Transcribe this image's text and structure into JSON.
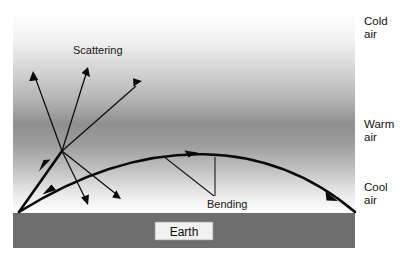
{
  "figure": {
    "canvas": {
      "width": 413,
      "height": 262,
      "background": "#ffffff"
    }
  },
  "labels": {
    "scattering": "Scattering",
    "bending": "Bending",
    "earth": "Earth",
    "cold_air_line1": "Cold",
    "cold_air_line2": "air",
    "warm_air_line1": "Warm",
    "warm_air_line2": "air",
    "cool_air_line1": "Cool",
    "cool_air_line2": "air"
  },
  "colors": {
    "ground": "#6e6e6e",
    "ray": "#0a0a0a",
    "text": "#111111",
    "earth_label_fill": "#f2f2f2",
    "atmosphere_top": "#ffffff",
    "atmosphere_mid": "#8f8f8f",
    "atmosphere_bottom": "#ffffff"
  },
  "atmosphere": {
    "box": {
      "x": 13,
      "y": 12,
      "width": 342,
      "height": 201
    },
    "gradient_stops": [
      {
        "offset": "0%",
        "color": "#ffffff"
      },
      {
        "offset": "14%",
        "color": "#f2f2f2"
      },
      {
        "offset": "30%",
        "color": "#d2d2d2"
      },
      {
        "offset": "45%",
        "color": "#b0b0b0"
      },
      {
        "offset": "56%",
        "color": "#8f8f8f"
      },
      {
        "offset": "66%",
        "color": "#9d9d9d"
      },
      {
        "offset": "78%",
        "color": "#c0c0c0"
      },
      {
        "offset": "90%",
        "color": "#e8e8e8"
      },
      {
        "offset": "100%",
        "color": "#ffffff"
      }
    ],
    "layer_order": [
      "Cold air",
      "Warm air",
      "Cool air"
    ]
  },
  "earth": {
    "band": {
      "x": 13,
      "y": 213,
      "width": 342,
      "height": 35
    },
    "label_box": {
      "x": 155,
      "y": 222,
      "width": 58,
      "height": 18
    }
  },
  "geometry": {
    "ground_origin": {
      "x": 19,
      "y": 212
    },
    "scatter_node": {
      "x": 62,
      "y": 151
    },
    "incoming_ray_to_scatter": {
      "from": {
        "x": 19,
        "y": 212
      },
      "to": {
        "x": 62,
        "y": 151
      }
    },
    "scattered_up_rays": [
      {
        "from": {
          "x": 62,
          "y": 151
        },
        "to": {
          "x": 33,
          "y": 73
        }
      },
      {
        "from": {
          "x": 62,
          "y": 151
        },
        "to": {
          "x": 88,
          "y": 68
        }
      },
      {
        "from": {
          "x": 62,
          "y": 151
        },
        "to": {
          "x": 141,
          "y": 82
        }
      }
    ],
    "scattered_down_rays": [
      {
        "from": {
          "x": 62,
          "y": 151
        },
        "to": {
          "x": 88,
          "y": 204
        }
      },
      {
        "from": {
          "x": 62,
          "y": 151
        },
        "to": {
          "x": 120,
          "y": 200
        }
      }
    ],
    "bending_curve": {
      "start": {
        "x": 19,
        "y": 212
      },
      "control1": {
        "x": 150,
        "y": 130
      },
      "control2": {
        "x": 270,
        "y": 140
      },
      "end": {
        "x": 355,
        "y": 212
      },
      "mid_arrow_at": {
        "x": 191,
        "y": 156
      },
      "late_arrow_at": {
        "x": 333,
        "y": 197
      }
    },
    "leader_lines": [
      {
        "from": {
          "x": 163,
          "y": 156
        },
        "to": {
          "x": 214,
          "y": 196
        }
      },
      {
        "from": {
          "x": 215,
          "y": 157
        },
        "to": {
          "x": 215,
          "y": 196
        }
      }
    ],
    "label_positions": {
      "scattering": {
        "x": 73,
        "y": 53
      },
      "bending": {
        "x": 207,
        "y": 207
      },
      "earth": {
        "x": 184,
        "y": 236
      },
      "cold_air": {
        "x": 364,
        "y": 26
      },
      "warm_air": {
        "x": 364,
        "y": 129
      },
      "cool_air": {
        "x": 364,
        "y": 192
      }
    }
  }
}
